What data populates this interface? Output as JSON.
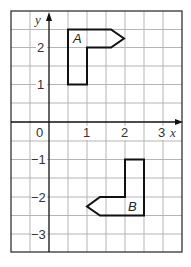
{
  "diagram": {
    "type": "coordinate-grid",
    "x_axis": {
      "label": "x",
      "min": -1,
      "max": 3.5,
      "tick_labels": [
        "0",
        "1",
        "2",
        "3"
      ],
      "ticks": [
        0,
        1,
        2,
        3
      ]
    },
    "y_axis": {
      "label": "y",
      "min": -3.5,
      "max": 3,
      "tick_labels": [
        "2",
        "1",
        "-1",
        "-2",
        "-3"
      ],
      "ticks": [
        2,
        1,
        -1,
        -2,
        -3
      ]
    },
    "grid_spacing": 0.5,
    "shapes": [
      {
        "label": "A",
        "vertices": [
          [
            0.5,
            2.5
          ],
          [
            1.67,
            2.5
          ],
          [
            2,
            2.25
          ],
          [
            1.67,
            2
          ],
          [
            1,
            2
          ],
          [
            1,
            1
          ],
          [
            0.5,
            1
          ]
        ]
      },
      {
        "label": "B",
        "vertices": [
          [
            2,
            -1
          ],
          [
            2.5,
            -1
          ],
          [
            2.5,
            -2.5
          ],
          [
            1.33,
            -2.5
          ],
          [
            1,
            -2.25
          ],
          [
            1.33,
            -2
          ],
          [
            2,
            -2
          ]
        ]
      }
    ],
    "colors": {
      "grid": "#b5b5b5",
      "border": "#333333",
      "axis": "#111111",
      "shape": "#111111"
    }
  },
  "labels": {
    "origin": "0",
    "x1": "1",
    "x2": "2",
    "x3": "3",
    "y2": "2",
    "y1": "1",
    "yn1": "−1",
    "yn2": "−2",
    "yn3": "−3",
    "x_name": "x",
    "y_name": "y",
    "shape_a": "A",
    "shape_b": "B"
  }
}
